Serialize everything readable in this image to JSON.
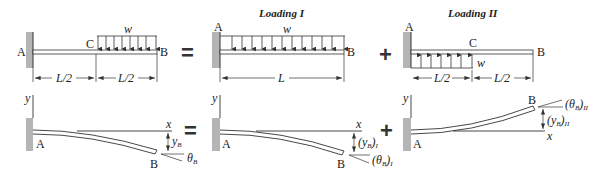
{
  "titles": {
    "loading_1": "Loading I",
    "loading_2": "Loading II"
  },
  "operators": {
    "equals": "=",
    "plus": "+"
  },
  "panel_original": {
    "point_a": "A",
    "point_b": "B",
    "point_c": "C",
    "load": "w",
    "dim_left": "L/2",
    "dim_right": "L/2",
    "axis_y": "y",
    "axis_x": "x",
    "deflection": "y",
    "deflection_sub": "B",
    "slope": "θ",
    "slope_sub": "B"
  },
  "panel_loading_1": {
    "point_a": "A",
    "point_b": "B",
    "load": "w",
    "dim": "L",
    "axis_y": "y",
    "axis_x": "x",
    "deflection": "(y",
    "deflection_sub": "B",
    "deflection_close": ")",
    "deflection_case": "I",
    "slope": "(θ",
    "slope_sub": "B",
    "slope_close": ")",
    "slope_case": "I"
  },
  "panel_loading_2": {
    "point_a": "A",
    "point_b": "B",
    "point_c": "C",
    "load": "w",
    "dim_left": "L/2",
    "dim_right": "L/2",
    "axis_y": "y",
    "axis_x": "x",
    "deflection": "(y",
    "deflection_sub": "B",
    "deflection_close": ")",
    "deflection_case": "II",
    "slope": "(θ",
    "slope_sub": "B",
    "slope_close": ")",
    "slope_case": "II"
  }
}
